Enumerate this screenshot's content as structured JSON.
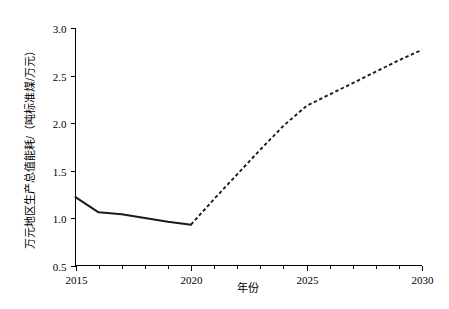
{
  "chart_data": {
    "type": "line",
    "title": "",
    "xlabel": "年份",
    "ylabel": "万元地区生产总值能耗/（吨标准煤/万元）",
    "xlim": [
      2015,
      2030
    ],
    "ylim": [
      0.5,
      3.0
    ],
    "grid": false,
    "legend": "none",
    "x_ticks": [
      2015,
      2020,
      2025,
      2030
    ],
    "x_tick_labels": [
      "2015",
      "2020",
      "2025",
      "2030"
    ],
    "x_minor_ticks": [
      2016,
      2017,
      2018,
      2019,
      2021,
      2022,
      2023,
      2024,
      2026,
      2027,
      2028,
      2029
    ],
    "y_ticks": [
      0.5,
      1.0,
      1.5,
      2.0,
      2.5,
      3.0
    ],
    "y_tick_labels": [
      "0.5",
      "1.0",
      "1.5",
      "2.0",
      "2.5",
      "3.0"
    ],
    "series": [
      {
        "name": "历史值",
        "style": "solid",
        "color": "#1a1a1a",
        "x": [
          2015,
          2016,
          2017,
          2018,
          2019,
          2020
        ],
        "values": [
          1.22,
          1.06,
          1.04,
          1.0,
          0.96,
          0.93
        ]
      },
      {
        "name": "预测值",
        "style": "dashed",
        "color": "#1a1a1a",
        "x": [
          2020,
          2021,
          2022,
          2023,
          2024,
          2025,
          2026,
          2027,
          2028,
          2029,
          2030
        ],
        "values": [
          0.93,
          1.2,
          1.46,
          1.72,
          1.97,
          2.18,
          2.3,
          2.42,
          2.54,
          2.66,
          2.77
        ]
      }
    ]
  },
  "axes": {
    "y_axis_label": "万元地区生产总值能耗/（吨标准煤/万元）",
    "x_axis_label": "年份"
  }
}
